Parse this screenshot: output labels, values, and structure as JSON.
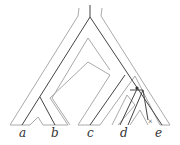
{
  "labels": {
    "a": "a",
    "b": "b",
    "c": "c",
    "d": "d",
    "e": "e"
  },
  "markers": {
    "duplication": "•",
    "loss": "x"
  },
  "colors": {
    "species_tree": "#aaaaaa",
    "gene_tree": "#444444"
  }
}
